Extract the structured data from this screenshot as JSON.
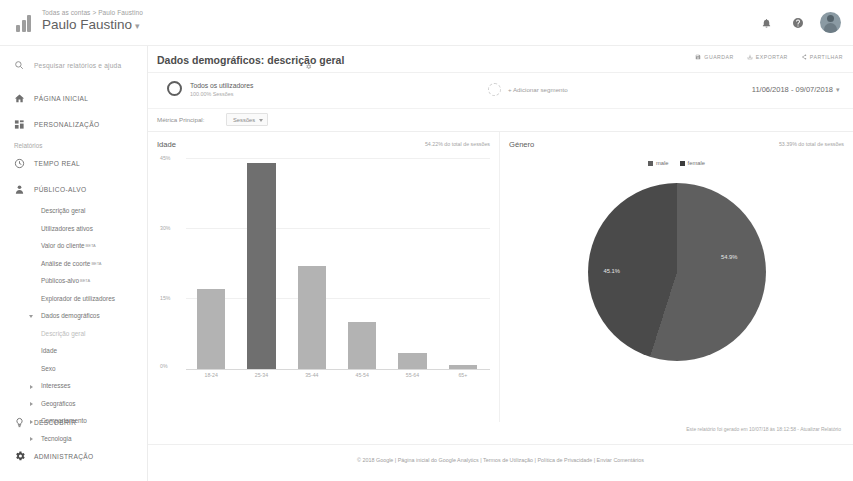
{
  "topbar": {
    "account_path": "Todas as contas > Paulo Faustino",
    "account_name": "Paulo Faustino",
    "caret": "▾",
    "icons": {
      "notifications": "bell-icon",
      "help": "help-icon",
      "avatar": "user-avatar"
    }
  },
  "sidebar": {
    "search_placeholder": "Pesquisar relatórios e ajuda",
    "primary": [
      {
        "label": "PÁGINA INICIAL",
        "icon": "home-icon"
      },
      {
        "label": "PERSONALIZAÇÃO",
        "icon": "customization-icon"
      }
    ],
    "section_label": "Relatórios",
    "reports": [
      {
        "label": "TEMPO REAL",
        "icon": "clock-icon"
      },
      {
        "label": "PÚBLICO-ALVO",
        "icon": "person-icon"
      }
    ],
    "audience_items": [
      {
        "label": "Descrição geral",
        "sup": ""
      },
      {
        "label": "Utilizadores ativos",
        "sup": ""
      },
      {
        "label": "Valor do cliente",
        "sup": "BETA"
      },
      {
        "label": "Análise de coorte",
        "sup": "BETA"
      },
      {
        "label": "Públicos-alvo",
        "sup": "BETA"
      },
      {
        "label": "Explorador de utilizadores",
        "sup": ""
      }
    ],
    "demographics_group": "Dados demográficos",
    "demographics_items": [
      {
        "label": "Descrição geral",
        "active": true
      },
      {
        "label": "Idade",
        "active": false
      },
      {
        "label": "Sexo",
        "active": false
      }
    ],
    "collapsed_groups": [
      "Interesses",
      "Geográficos",
      "Comportamento",
      "Tecnologia"
    ],
    "bottom": [
      {
        "label": "DESCOBRIR",
        "icon": "lightbulb-icon"
      },
      {
        "label": "ADMINISTRAÇÃO",
        "icon": "gear-icon"
      }
    ]
  },
  "page": {
    "title": "Dados demográficos: descrição geral",
    "title_gear": "gear-icon",
    "actions": [
      {
        "label": "GUARDAR",
        "icon": "save-icon"
      },
      {
        "label": "EXPORTAR",
        "icon": "export-icon"
      },
      {
        "label": "PARTILHAR",
        "icon": "share-icon"
      }
    ],
    "segment": {
      "name": "Todos os utilizadores",
      "sub": "100.00% Sessões",
      "add_label": "+ Adicionar segmento"
    },
    "date_range": "11/06/2018 - 09/07/2018",
    "date_caret": "▾",
    "metric": {
      "label": "Métrica Principal:",
      "value": "Sessões"
    },
    "report_generated": "Este relatório foi gerado em 10/07/18 às 18:12:58 - Atualizar Relatório",
    "footer": "© 2018 Google | Página inicial do Google Analytics | Termos de Utilização | Política de Privacidade | Enviar Comentários"
  },
  "chart_data": [
    {
      "type": "bar",
      "title": "Idade",
      "subtitle": "54.22% do total de sessões",
      "categories": [
        "18-24",
        "25-34",
        "35-44",
        "45-54",
        "55-64",
        "65+"
      ],
      "values": [
        17.0,
        44.0,
        22.0,
        10.0,
        3.5,
        0.8
      ],
      "highlight_index": 1,
      "xlabel": "",
      "ylabel": "",
      "ylim": [
        0,
        45
      ],
      "yticks": [
        "45%",
        "30%",
        "15%",
        "0%"
      ],
      "grid": true,
      "colors": {
        "bar": "#b3b3b3",
        "bar_highlight": "#6f6f6f"
      }
    },
    {
      "type": "pie",
      "title": "Género",
      "subtitle": "53.39% do total de sessões",
      "legend": [
        "male",
        "female"
      ],
      "legend_position": "top",
      "labels": [
        "male",
        "female"
      ],
      "values": [
        54.9,
        45.1
      ],
      "value_labels": [
        "54.9%",
        "45.1%"
      ],
      "colors": {
        "male": "#5f5f5f",
        "female": "#4a4a4a"
      }
    }
  ]
}
